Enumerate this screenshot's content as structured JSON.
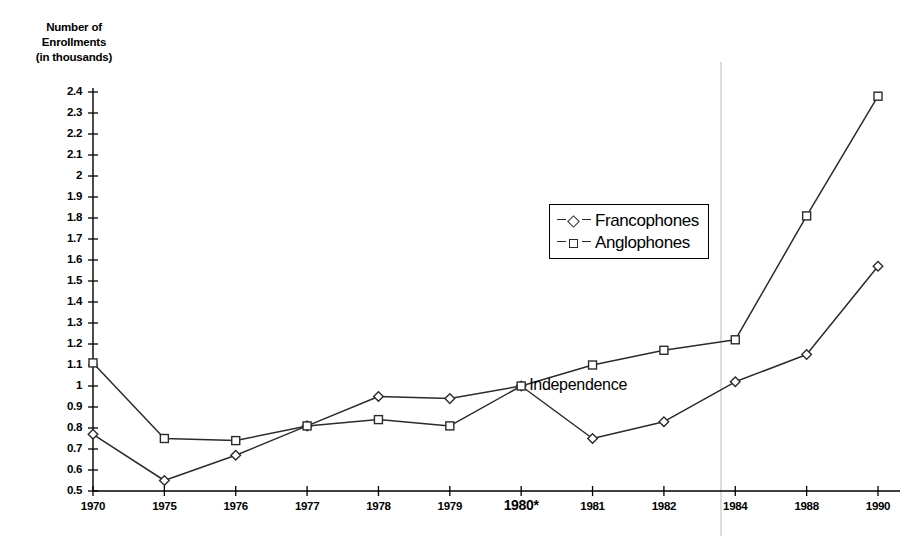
{
  "chart_data": {
    "type": "line",
    "title": "",
    "ylabel": "Number of Enrollments (in thousands)",
    "xlabel": "",
    "categories": [
      "1970",
      "1975",
      "1976",
      "1977",
      "1978",
      "1979",
      "1980*",
      "1981",
      "1982",
      "1984",
      "1988",
      "1990"
    ],
    "series": [
      {
        "name": "Francophones",
        "marker": "diamond",
        "values": [
          0.77,
          0.55,
          0.67,
          0.81,
          0.95,
          0.94,
          1.0,
          0.75,
          0.83,
          1.02,
          1.15,
          1.57
        ]
      },
      {
        "name": "Anglophones",
        "marker": "square",
        "values": [
          1.11,
          0.75,
          0.74,
          0.81,
          0.84,
          0.81,
          1.0,
          1.1,
          1.17,
          1.22,
          1.81,
          2.38
        ]
      }
    ],
    "ylim": [
      0.5,
      2.4
    ],
    "ytick_step": 0.1,
    "yticks": [
      "2.4",
      "2.3",
      "2.2",
      "2.1",
      "2",
      "1.9",
      "1.8",
      "1.7",
      "1.6",
      "1.5",
      "1.4",
      "1.3",
      "1.2",
      "1.1",
      "1",
      "0.9",
      "0.8",
      "0.7",
      "0.6",
      "0.5"
    ],
    "grid": false,
    "legend_position": "center-right",
    "annotations": [
      {
        "text": "Independence",
        "at_category": "1980*",
        "at_value": 1.0
      }
    ],
    "reference_line": {
      "label": "",
      "between": "1982-1984",
      "color": "#b9b9b9"
    },
    "colors": {
      "line": "#2b2b2b",
      "marker_fill": "#ffffff",
      "axis": "#000000",
      "background": "#ffffff"
    }
  },
  "axis_title": {
    "line1": "Number of",
    "line2": "Enrollments",
    "line3": "(in thousands)"
  },
  "legend": {
    "items": [
      {
        "label": "Francophones"
      },
      {
        "label": "Anglophones"
      }
    ]
  },
  "annotation_text": "Independence"
}
